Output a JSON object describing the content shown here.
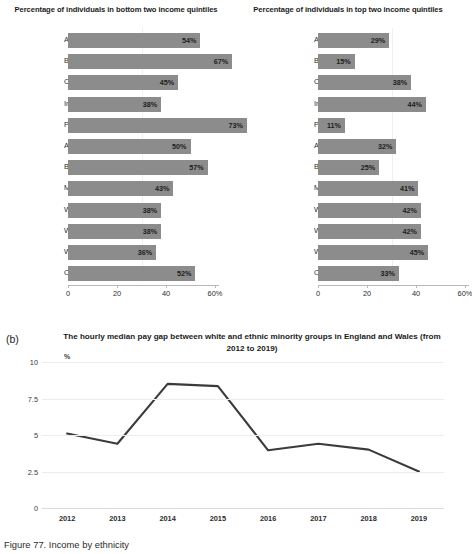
{
  "figure": {
    "caption": "Figure 77. Income by ethnicity",
    "panel_b_tag": "(b)"
  },
  "chart_data": [
    {
      "type": "bar",
      "orientation": "horizontal",
      "title": "Percentage of individuals in bottom two income quintiles",
      "xlabel": "",
      "ylabel": "",
      "xlim": [
        0,
        60
      ],
      "xticks": [
        0,
        20,
        40,
        60
      ],
      "xticklabels": [
        "0",
        "20",
        "40",
        "60%"
      ],
      "grid": false,
      "bar_color": "#8c8c8c",
      "categories": [
        "Asian",
        "Bangladeshi",
        "Chinese",
        "Indian",
        "Pakistani",
        "Asian other",
        "Black",
        "Mixed",
        "White",
        "White British",
        "White other",
        "Other"
      ],
      "values": [
        54,
        67,
        45,
        38,
        73,
        50,
        57,
        43,
        38,
        38,
        36,
        52
      ],
      "value_labels": [
        "54%",
        "67%",
        "45%",
        "38%",
        "73%",
        "50%",
        "57%",
        "43%",
        "38%",
        "38%",
        "36%",
        "52%"
      ]
    },
    {
      "type": "bar",
      "orientation": "horizontal",
      "title": "Percentage of individuals in top two income quintiles",
      "xlabel": "",
      "ylabel": "",
      "xlim": [
        0,
        60
      ],
      "xticks": [
        0,
        20,
        40,
        60
      ],
      "xticklabels": [
        "0",
        "20",
        "40",
        "60%"
      ],
      "grid": false,
      "bar_color": "#8c8c8c",
      "categories": [
        "Asian",
        "Bangladeshi",
        "Chinese",
        "Indian",
        "Pakistani",
        "Asian other",
        "Black",
        "Mixed",
        "White",
        "White British",
        "White other",
        "Other"
      ],
      "values": [
        29,
        15,
        38,
        44,
        11,
        32,
        25,
        41,
        42,
        42,
        45,
        33
      ],
      "value_labels": [
        "29%",
        "15%",
        "38%",
        "44%",
        "11%",
        "32%",
        "25%",
        "41%",
        "42%",
        "42%",
        "45%",
        "33%"
      ]
    },
    {
      "type": "line",
      "title": "The hourly median pay gap between white and ethnic minority groups in England and Wales (from 2012 to 2019)",
      "xlabel": "",
      "ylabel": "%",
      "unit_label": "%",
      "ylim": [
        0,
        10
      ],
      "yticks": [
        0,
        2.5,
        5,
        7.5,
        10
      ],
      "yticklabels": [
        "0",
        "2.5",
        "5",
        "7.5",
        "10"
      ],
      "grid": true,
      "legend": false,
      "line_color": "#3b3b3b",
      "x": [
        "2012",
        "2013",
        "2014",
        "2015",
        "2016",
        "2017",
        "2018",
        "2019"
      ],
      "values": [
        5.1,
        4.4,
        8.5,
        8.35,
        3.95,
        4.4,
        4.0,
        2.5
      ]
    }
  ]
}
